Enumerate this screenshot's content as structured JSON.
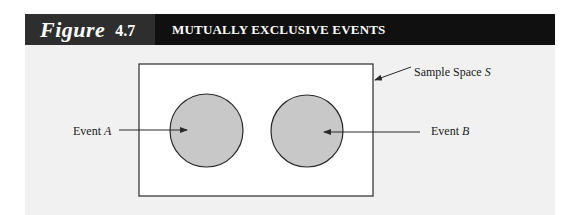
{
  "figure": {
    "word": "Figure",
    "number": "4.7",
    "title": "MUTUALLY EXCLUSIVE EVENTS"
  },
  "diagram": {
    "type": "venn",
    "sample_space": {
      "label_text": "Sample Space ",
      "label_var": "S"
    },
    "events": [
      {
        "label_text": "Event ",
        "label_var": "A",
        "fill": "#c8c8c8"
      },
      {
        "label_text": "Event ",
        "label_var": "B",
        "fill": "#c8c8c8"
      }
    ],
    "colors": {
      "header_label_bg": "#2e2e2e",
      "header_title_bg": "#101010",
      "panel_bg": "#f1f1f1",
      "circle_fill": "#c8c8c8",
      "stroke": "#2a2a2a"
    }
  }
}
